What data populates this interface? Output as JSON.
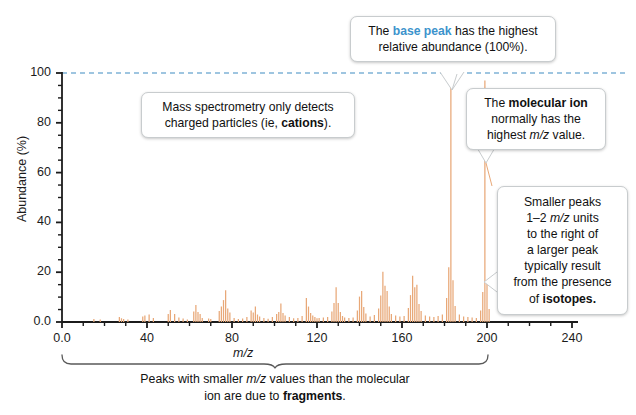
{
  "chart_data": {
    "type": "bar",
    "title": "",
    "xlabel": "m/z",
    "ylabel": "Abundance (%)",
    "xlim": [
      0,
      245
    ],
    "ylim": [
      0,
      104
    ],
    "grid": false,
    "legend": null,
    "xticks": [
      "0.0",
      "40",
      "80",
      "120",
      "160",
      "200",
      "240"
    ],
    "xtick_values": [
      0,
      40,
      80,
      120,
      160,
      200,
      240
    ],
    "xminor_step": 10,
    "yticks": [
      "0.0",
      "20",
      "40",
      "60",
      "80",
      "100"
    ],
    "ytick_values": [
      0,
      20,
      40,
      60,
      80,
      100
    ],
    "yminor_step": 5,
    "reference_line": {
      "y": 100,
      "style": "dashed",
      "color": "#7fb2d6"
    },
    "bar_color": "#e8a878",
    "base_peak": {
      "mz": 183,
      "abundance": 100
    },
    "molecular_ion": {
      "mz": 199,
      "abundance": 97
    },
    "x": [
      15,
      18,
      27,
      28,
      29,
      31,
      38,
      39,
      41,
      43,
      50,
      51,
      53,
      55,
      57,
      59,
      62,
      63,
      64,
      65,
      66,
      69,
      70,
      74,
      75,
      76,
      77,
      78,
      79,
      81,
      83,
      85,
      87,
      89,
      90,
      91,
      92,
      93,
      95,
      97,
      99,
      101,
      102,
      103,
      104,
      105,
      107,
      109,
      111,
      113,
      115,
      116,
      117,
      118,
      119,
      120,
      121,
      123,
      125,
      127,
      128,
      129,
      130,
      131,
      132,
      133,
      135,
      137,
      139,
      140,
      141,
      142,
      143,
      145,
      147,
      149,
      150,
      151,
      152,
      153,
      154,
      155,
      157,
      159,
      161,
      163,
      164,
      165,
      166,
      167,
      168,
      169,
      171,
      173,
      175,
      177,
      179,
      181,
      182,
      183,
      184,
      185,
      187,
      189,
      191,
      193,
      195,
      197,
      198,
      199,
      200,
      201
    ],
    "values": [
      1.2,
      1.0,
      2.0,
      1.5,
      1.2,
      1.0,
      2.2,
      2.6,
      3.0,
      1.6,
      3.2,
      4.8,
      3.2,
      1.8,
      1.4,
      1.0,
      4.2,
      6.8,
      4.0,
      3.2,
      1.6,
      1.4,
      1.2,
      4.4,
      6.2,
      8.8,
      12.8,
      5.4,
      3.8,
      1.6,
      1.2,
      1.4,
      2.0,
      4.6,
      3.8,
      6.2,
      3.0,
      2.2,
      1.6,
      1.3,
      2.0,
      3.2,
      4.0,
      7.4,
      3.6,
      2.6,
      2.0,
      1.5,
      1.6,
      2.4,
      9.6,
      6.2,
      3.6,
      2.6,
      2.0,
      1.5,
      1.6,
      1.8,
      2.0,
      4.2,
      7.6,
      14.0,
      7.6,
      4.0,
      2.4,
      1.8,
      1.6,
      1.8,
      4.6,
      10.2,
      12.4,
      6.0,
      3.4,
      2.2,
      2.8,
      5.4,
      10.6,
      20.2,
      14.6,
      12.4,
      6.2,
      3.2,
      2.6,
      2.2,
      2.4,
      5.6,
      10.8,
      18.6,
      14.0,
      15.0,
      7.2,
      4.4,
      2.6,
      2.2,
      2.0,
      2.4,
      3.0,
      9.6,
      22.0,
      100.0,
      16.8,
      6.4,
      3.0,
      2.2,
      2.0,
      1.8,
      1.6,
      4.6,
      12.0,
      97.0,
      16.2,
      5.2
    ]
  },
  "annotations": {
    "base_peak": {
      "line1_prefix": "The ",
      "line1_accent": "base peak",
      "line1_suffix": " has the highest",
      "line2": "relative abundance (100%)."
    },
    "cations": {
      "line1": "Mass spectrometry only detects",
      "line2_prefix": "charged particles (ie, ",
      "line2_bold": "cations",
      "line2_suffix": ")."
    },
    "molecular_ion": {
      "line1_prefix": "The ",
      "line1_bold": "molecular ion",
      "line2": "normally has the",
      "line3_prefix": "highest ",
      "line3_italic": "m/z",
      "line3_suffix": " value."
    },
    "isotopes": {
      "line1": "Smaller peaks",
      "line2_prefix": "1–2 ",
      "line2_italic": "m/z",
      "line2_suffix": " units",
      "line3": "to the right of",
      "line4": "a larger peak",
      "line5": "typically result",
      "line6": "from the presence",
      "line7_prefix": "of ",
      "line7_bold": "isotopes."
    },
    "fragments_caption": {
      "line1_prefix": "Peaks with smaller ",
      "line1_italic": "m/z",
      "line1_suffix": " values than the molecular",
      "line2_prefix": "ion are due to ",
      "line2_bold": "fragments",
      "line2_suffix": "."
    }
  },
  "colors": {
    "peak": "#e8a878",
    "accent_blue": "#3c93cc",
    "reference_dash": "#7fb2d6",
    "axis": "#1b1b1b",
    "callout_border": "#c8ccce",
    "bracket": "#595959"
  }
}
